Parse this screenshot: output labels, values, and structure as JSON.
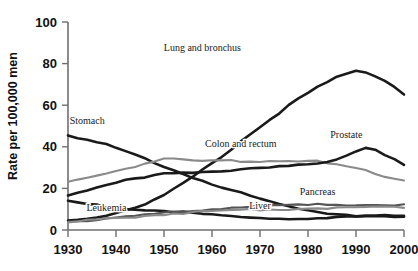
{
  "chart_data": {
    "type": "line",
    "title": "",
    "xlabel": "",
    "ylabel": "Rate per 100,000 men",
    "xlim": [
      1930,
      2000
    ],
    "ylim": [
      0,
      100
    ],
    "grid": false,
    "legend": "inline-annotations",
    "x_ticks": [
      "1930",
      "1940",
      "1950",
      "1960",
      "1970",
      "1980",
      "1990",
      "2000"
    ],
    "y_ticks": [
      "0",
      "20",
      "40",
      "60",
      "80",
      "100"
    ],
    "x": [
      1930,
      1932,
      1934,
      1936,
      1938,
      1940,
      1942,
      1944,
      1946,
      1948,
      1950,
      1952,
      1954,
      1956,
      1958,
      1960,
      1962,
      1964,
      1966,
      1968,
      1970,
      1972,
      1974,
      1976,
      1978,
      1980,
      1982,
      1984,
      1986,
      1988,
      1990,
      1992,
      1994,
      1996,
      1998,
      2000
    ],
    "series": [
      {
        "name": "Lung and bronchus",
        "color": "#1a1a1a",
        "label_x": 1958,
        "label_y": 86,
        "values": [
          4.5,
          5.0,
          5.6,
          6.3,
          7.2,
          8.3,
          9.6,
          11.0,
          12.5,
          14.4,
          16.8,
          19.5,
          22.3,
          25.4,
          28.6,
          32.0,
          35.4,
          39.0,
          42.6,
          46.2,
          49.5,
          53.0,
          56.5,
          59.8,
          62.8,
          65.8,
          68.5,
          71.0,
          73.2,
          75.0,
          76.4,
          76.0,
          74.2,
          72.0,
          69.0,
          65.6
        ]
      },
      {
        "name": "Stomach",
        "color": "#1a1a1a",
        "label_x": 1934,
        "label_y": 51,
        "values": [
          46.0,
          44.6,
          43.2,
          42.0,
          40.8,
          39.2,
          37.6,
          36.0,
          34.2,
          32.4,
          30.6,
          28.8,
          27.0,
          25.4,
          23.8,
          22.0,
          20.4,
          19.0,
          17.6,
          16.2,
          14.8,
          13.6,
          12.4,
          11.4,
          10.5,
          9.6,
          8.9,
          8.3,
          7.8,
          7.4,
          7.1,
          6.8,
          6.6,
          6.4,
          6.2,
          6.0
        ]
      },
      {
        "name": "Colon and rectum",
        "color": "#8a8a8a",
        "label_x": 1966,
        "label_y": 40,
        "values": [
          23.0,
          24.0,
          25.0,
          26.2,
          27.4,
          28.4,
          29.6,
          30.8,
          32.0,
          33.4,
          34.2,
          34.0,
          33.6,
          33.4,
          33.2,
          33.4,
          33.2,
          33.4,
          33.2,
          33.4,
          33.2,
          33.4,
          33.2,
          33.6,
          33.4,
          33.2,
          32.8,
          32.0,
          31.2,
          30.4,
          29.4,
          28.4,
          27.2,
          26.0,
          25.0,
          24.0
        ]
      },
      {
        "name": "Prostate",
        "color": "#1a1a1a",
        "label_x": 1988,
        "label_y": 44,
        "values": [
          17.0,
          18.0,
          19.2,
          20.4,
          21.6,
          22.6,
          23.6,
          24.6,
          25.2,
          26.2,
          27.0,
          27.4,
          27.8,
          28.0,
          28.2,
          28.4,
          28.6,
          28.8,
          29.0,
          29.2,
          29.4,
          29.8,
          30.2,
          30.6,
          31.0,
          31.4,
          32.0,
          33.0,
          34.2,
          36.0,
          38.2,
          39.8,
          38.6,
          36.0,
          33.6,
          31.0
        ]
      },
      {
        "name": "Liver",
        "color": "#1a1a1a",
        "label_x": 1970,
        "label_y": 10,
        "values": [
          14.0,
          13.2,
          12.4,
          11.8,
          11.2,
          10.6,
          10.2,
          9.8,
          9.6,
          9.4,
          9.2,
          8.8,
          8.4,
          8.0,
          7.6,
          7.2,
          6.8,
          6.5,
          6.2,
          6.0,
          5.8,
          5.6,
          5.5,
          5.4,
          5.4,
          5.4,
          5.5,
          5.6,
          5.8,
          6.0,
          6.2,
          6.4,
          6.6,
          6.8,
          7.0,
          7.2
        ]
      },
      {
        "name": "Pancreas",
        "color": "#555555",
        "label_x": 1982,
        "label_y": 17,
        "values": [
          4.0,
          4.4,
          4.8,
          5.2,
          5.6,
          6.0,
          6.4,
          6.8,
          7.2,
          7.6,
          8.0,
          8.4,
          8.8,
          9.2,
          9.6,
          10.0,
          10.4,
          10.8,
          11.0,
          11.2,
          11.4,
          11.6,
          11.8,
          12.0,
          12.0,
          12.0,
          12.1,
          12.2,
          12.2,
          12.2,
          12.2,
          12.2,
          12.2,
          12.2,
          12.2,
          12.2
        ]
      },
      {
        "name": "Leukemia",
        "color": "#8a8a8a",
        "label_x": 1938,
        "label_y": 9,
        "values": [
          3.6,
          4.0,
          4.4,
          4.8,
          5.2,
          5.6,
          6.0,
          6.4,
          6.8,
          7.2,
          7.6,
          8.0,
          8.2,
          8.4,
          8.6,
          8.8,
          9.0,
          9.2,
          9.4,
          9.6,
          9.8,
          10.0,
          10.1,
          10.2,
          10.3,
          10.4,
          10.5,
          10.6,
          10.7,
          10.8,
          10.9,
          11.0,
          11.0,
          11.0,
          10.9,
          10.8
        ]
      }
    ]
  }
}
